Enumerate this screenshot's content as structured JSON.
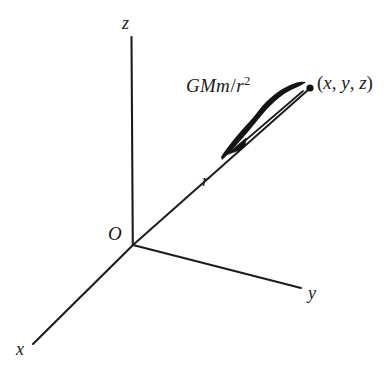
{
  "figure": {
    "background_color": "#ffffff",
    "ink_color": "#1b1b1b",
    "axes": [
      {
        "name": "z",
        "label": "z",
        "from": [
          133,
          245
        ],
        "to": [
          131,
          37
        ]
      },
      {
        "name": "y",
        "label": "y",
        "from": [
          133,
          245
        ],
        "to": [
          301,
          288
        ]
      },
      {
        "name": "x",
        "label": "x",
        "from": [
          133,
          245
        ],
        "to": [
          33,
          344
        ]
      }
    ],
    "origin": {
      "label": "O",
      "at": [
        133,
        245
      ]
    },
    "radius_line": {
      "label": "r",
      "from": [
        133,
        245
      ],
      "to": [
        311,
        88
      ]
    },
    "point": {
      "label_open": "(",
      "label_x": "x",
      "comma_1": ", ",
      "label_y": "y",
      "comma_2": ", ",
      "label_z": "z",
      "label_close": ")",
      "at": [
        311,
        88
      ]
    },
    "force_vector": {
      "label_main": "GMm",
      "label_slash": "/",
      "label_denom": "r",
      "label_exponent": "2",
      "direction": "toward origin",
      "arrowhead_at": [
        238,
        143
      ]
    }
  }
}
